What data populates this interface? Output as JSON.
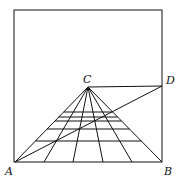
{
  "diagram": {
    "type": "perspective-construction",
    "labels": {
      "A": "A",
      "B": "B",
      "C": "C",
      "D": "D"
    },
    "points": {
      "A": [
        15,
        162
      ],
      "B": [
        162,
        162
      ],
      "C": [
        88,
        87
      ],
      "D": [
        162,
        86
      ]
    },
    "frame": {
      "x1": 14,
      "y1": 10,
      "x2": 162,
      "y2": 162
    },
    "base_points_x": [
      15,
      44,
      73,
      103,
      132,
      162
    ],
    "transversal_y": [
      112,
      117,
      121,
      129,
      141
    ],
    "stroke_color": "#111111"
  }
}
